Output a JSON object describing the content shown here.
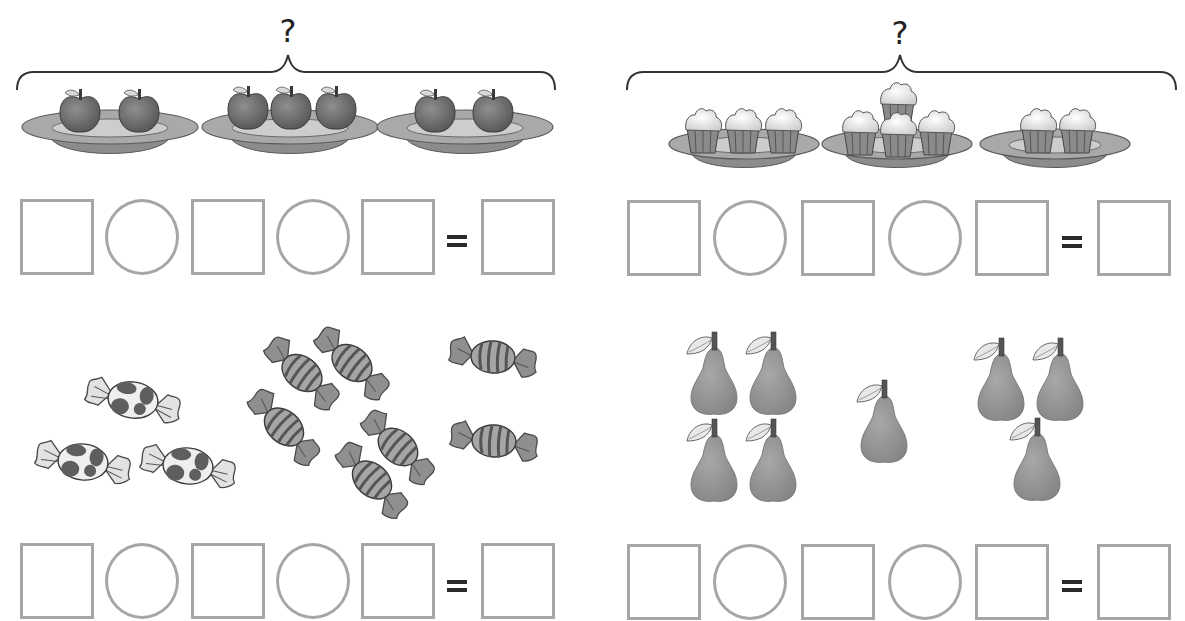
{
  "worksheet": {
    "problems": [
      {
        "id": "apples",
        "question_mark": "?",
        "item": "apple",
        "groups": [
          2,
          3,
          2
        ],
        "container": "plate",
        "answer_row": {
          "slots": [
            "box",
            "circle",
            "box",
            "circle",
            "box"
          ],
          "equals": "=",
          "result": "box"
        }
      },
      {
        "id": "cupcakes",
        "question_mark": "?",
        "item": "cupcake",
        "groups": [
          3,
          4,
          2
        ],
        "container": "plate",
        "answer_row": {
          "slots": [
            "box",
            "circle",
            "box",
            "circle",
            "box"
          ],
          "equals": "=",
          "result": "box"
        }
      },
      {
        "id": "candies",
        "item": "candy",
        "groups": [
          3,
          5,
          2
        ],
        "group_styles": [
          "spotted",
          "striped-diagonal",
          "striped-horizontal"
        ],
        "answer_row": {
          "slots": [
            "box",
            "circle",
            "box",
            "circle",
            "box"
          ],
          "equals": "=",
          "result": "box"
        }
      },
      {
        "id": "pears",
        "item": "pear",
        "groups": [
          4,
          1,
          3
        ],
        "answer_row": {
          "slots": [
            "box",
            "circle",
            "box",
            "circle",
            "box"
          ],
          "equals": "=",
          "result": "box"
        }
      }
    ],
    "colors": {
      "outline_gray": "#a6a6a6",
      "ink": "#2a2a2a",
      "fruit_dark": "#6e6e6e",
      "fruit_mid": "#8a8a8a",
      "plate_light": "#c8c8c8",
      "plate_mid": "#9a9a9a",
      "leaf_light": "#e6e6e6"
    }
  }
}
